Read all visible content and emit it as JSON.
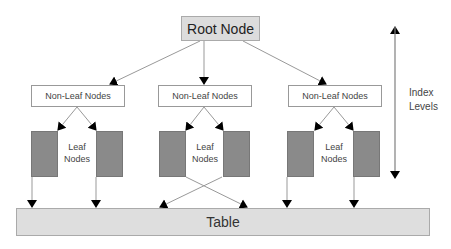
{
  "diagram": {
    "type": "B-tree index structure",
    "root": {
      "label": "Root Node"
    },
    "non_leaf_nodes": [
      {
        "label": "Non-Leaf Nodes"
      },
      {
        "label": "Non-Leaf Nodes"
      },
      {
        "label": "Non-Leaf Nodes"
      }
    ],
    "leaf_groups": [
      {
        "label_line1": "Leaf",
        "label_line2": "Nodes"
      },
      {
        "label_line1": "Leaf",
        "label_line2": "Nodes"
      },
      {
        "label_line1": "Leaf",
        "label_line2": "Nodes"
      }
    ],
    "table": {
      "label": "Table"
    },
    "index_levels": {
      "line1": "Index",
      "line2": "Levels"
    },
    "colors": {
      "root_fill": "#dcdcdc",
      "leaf_fill": "#8a8a8a",
      "table_fill": "#dedede",
      "arrow": "#000000",
      "line": "#999999"
    }
  }
}
